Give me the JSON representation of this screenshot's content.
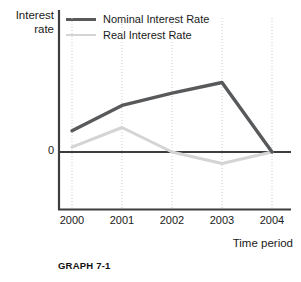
{
  "figure": {
    "caption": "GRAPH 7-1",
    "y_axis_title_line1": "Interest",
    "y_axis_title_line2": "rate",
    "x_axis_title": "Time period",
    "zero_label": "0"
  },
  "legend": {
    "position": "top-left-inside",
    "items": [
      {
        "label": "Nominal Interest Rate",
        "color": "#58595b",
        "swatch": "thick-line-swatch"
      },
      {
        "label": "Real Interest Rate",
        "color": "#d4d4d4",
        "swatch": "thin-line-swatch"
      }
    ]
  },
  "colors": {
    "nominal": "#58595b",
    "real": "#d4d4d4",
    "axis": "#3d3d3d",
    "gridline": "#cfcfcf",
    "background": "#ffffff",
    "text": "#1a1a1a"
  },
  "chart_data": {
    "type": "line",
    "title": "GRAPH 7-1",
    "xlabel": "Time period",
    "ylabel": "Interest rate",
    "categories": [
      "2000",
      "2001",
      "2002",
      "2003",
      "2004"
    ],
    "x": [
      2000,
      2001,
      2002,
      2003,
      2004
    ],
    "series": [
      {
        "name": "Nominal Interest Rate",
        "color": "#58595b",
        "values": [
          2.6,
          5.7,
          7.2,
          8.5,
          0
        ]
      },
      {
        "name": "Real Interest Rate",
        "color": "#d4d4d4",
        "values": [
          0.6,
          3.0,
          0,
          -1.4,
          0
        ]
      }
    ],
    "ylim": [
      -5.8,
      11.5
    ],
    "yticks": [
      0
    ],
    "ytick_labels": [
      "0"
    ],
    "grid": "vertical-dotted-at-each-category",
    "legend_position": "upper left",
    "zero_line": true
  }
}
